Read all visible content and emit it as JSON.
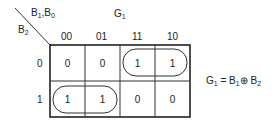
{
  "kmap": {
    "title": "G",
    "title_sub": "1",
    "col_var": {
      "a": "B",
      "a_sub": "1",
      "sep": ",",
      "b": "B",
      "b_sub": "0"
    },
    "row_var": {
      "a": "B",
      "a_sub": "2"
    },
    "col_headers": [
      "00",
      "01",
      "11",
      "10"
    ],
    "row_headers": [
      "0",
      "1"
    ],
    "cells": [
      [
        "0",
        "0",
        "1",
        "1"
      ],
      [
        "1",
        "1",
        "0",
        "0"
      ]
    ],
    "groups": [
      {
        "row": 0,
        "cols": [
          2,
          3
        ]
      },
      {
        "row": 1,
        "cols": [
          0,
          1
        ]
      }
    ]
  },
  "equation": {
    "lhs": "G",
    "lhs_sub": "1",
    "eq": "=",
    "t1": "B",
    "t1_sub": "1",
    "op": "⊕",
    "t2": "B",
    "t2_sub": "2"
  }
}
